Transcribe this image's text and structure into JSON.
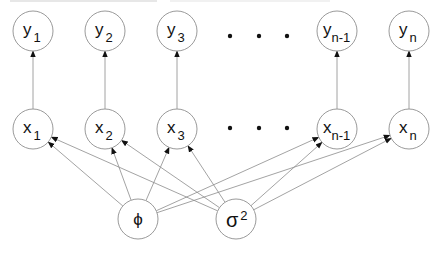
{
  "diagram": {
    "node_style": {
      "stroke": "#9a9a9a",
      "fill": "#ffffff",
      "radius": 20
    },
    "edge_color": "#8c8c8c",
    "observed_row": [
      {
        "id": "y1",
        "base": "y",
        "sub": "1",
        "cx": 33,
        "cy": 31
      },
      {
        "id": "y2",
        "base": "y",
        "sub": "2",
        "cx": 105,
        "cy": 31
      },
      {
        "id": "y3",
        "base": "y",
        "sub": "3",
        "cx": 177,
        "cy": 31
      },
      {
        "id": "yn-1",
        "base": "y",
        "sub": "n-1",
        "cx": 337,
        "cy": 31
      },
      {
        "id": "yn",
        "base": "y",
        "sub": "n",
        "cx": 409,
        "cy": 31
      }
    ],
    "hidden_row": [
      {
        "id": "x1",
        "base": "x",
        "sub": "1",
        "cx": 33,
        "cy": 129
      },
      {
        "id": "x2",
        "base": "x",
        "sub": "2",
        "cx": 105,
        "cy": 129
      },
      {
        "id": "x3",
        "base": "x",
        "sub": "3",
        "cx": 177,
        "cy": 129
      },
      {
        "id": "xn-1",
        "base": "x",
        "sub": "n-1",
        "cx": 337,
        "cy": 129
      },
      {
        "id": "xn",
        "base": "x",
        "sub": "n",
        "cx": 409,
        "cy": 129
      }
    ],
    "parameters": [
      {
        "id": "phi",
        "base": "ϕ",
        "sup": "",
        "cx": 138,
        "cy": 219
      },
      {
        "id": "sigma2",
        "base": "σ",
        "sup": "2",
        "cx": 236,
        "cy": 219
      }
    ],
    "ellipsis_dots": {
      "x_positions": [
        230,
        259,
        287
      ],
      "rows_y": [
        36,
        128
      ]
    },
    "edges": [
      {
        "from": "x1",
        "to": "y1"
      },
      {
        "from": "x2",
        "to": "y2"
      },
      {
        "from": "x3",
        "to": "y3"
      },
      {
        "from": "xn-1",
        "to": "yn-1"
      },
      {
        "from": "xn",
        "to": "yn"
      },
      {
        "from": "phi",
        "to": "x1"
      },
      {
        "from": "phi",
        "to": "x2"
      },
      {
        "from": "phi",
        "to": "x3"
      },
      {
        "from": "phi",
        "to": "xn-1"
      },
      {
        "from": "phi",
        "to": "xn"
      },
      {
        "from": "sigma2",
        "to": "x1"
      },
      {
        "from": "sigma2",
        "to": "x2"
      },
      {
        "from": "sigma2",
        "to": "x3"
      },
      {
        "from": "sigma2",
        "to": "xn-1"
      },
      {
        "from": "sigma2",
        "to": "xn"
      }
    ]
  }
}
